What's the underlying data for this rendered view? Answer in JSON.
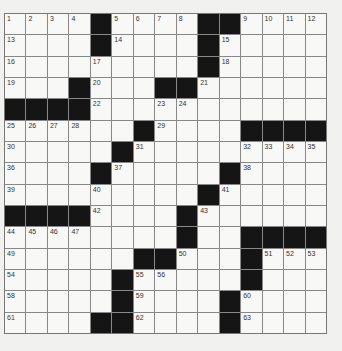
{
  "puzzle": {
    "type": "crossword",
    "rows": 15,
    "cols": 15,
    "colors": {
      "background": "#f1f1ef",
      "cell": "#f8f8f6",
      "block": "#151515",
      "gridline": "#888888",
      "number": "#333333"
    },
    "layout": [
      "....#....##....",
      "....#....#.....",
      ".........#.....",
      "...#...##......",
      "####...........",
      "......#....####",
      ".....#.........",
      "....#.....#....",
      ".........#.....",
      "####....#......",
      "........#..####",
      "......##...#...",
      ".....#.....#...",
      ".....#....#....",
      "....##....#...."
    ],
    "numbers": [
      {
        "r": 0,
        "c": 0,
        "n": "1"
      },
      {
        "r": 0,
        "c": 1,
        "n": "2"
      },
      {
        "r": 0,
        "c": 2,
        "n": "3"
      },
      {
        "r": 0,
        "c": 3,
        "n": "4"
      },
      {
        "r": 0,
        "c": 5,
        "n": "5"
      },
      {
        "r": 0,
        "c": 6,
        "n": "6"
      },
      {
        "r": 0,
        "c": 7,
        "n": "7"
      },
      {
        "r": 0,
        "c": 8,
        "n": "8"
      },
      {
        "r": 0,
        "c": 11,
        "n": "9"
      },
      {
        "r": 0,
        "c": 12,
        "n": "10"
      },
      {
        "r": 0,
        "c": 13,
        "n": "11"
      },
      {
        "r": 0,
        "c": 14,
        "n": "12"
      },
      {
        "r": 1,
        "c": 0,
        "n": "13"
      },
      {
        "r": 1,
        "c": 5,
        "n": "14"
      },
      {
        "r": 1,
        "c": 10,
        "n": "15"
      },
      {
        "r": 2,
        "c": 0,
        "n": "16"
      },
      {
        "r": 2,
        "c": 4,
        "n": "17"
      },
      {
        "r": 2,
        "c": 10,
        "n": "18"
      },
      {
        "r": 3,
        "c": 0,
        "n": "19"
      },
      {
        "r": 3,
        "c": 4,
        "n": "20"
      },
      {
        "r": 3,
        "c": 9,
        "n": "21"
      },
      {
        "r": 4,
        "c": 4,
        "n": "22"
      },
      {
        "r": 4,
        "c": 7,
        "n": "23"
      },
      {
        "r": 4,
        "c": 8,
        "n": "24"
      },
      {
        "r": 5,
        "c": 0,
        "n": "25"
      },
      {
        "r": 5,
        "c": 1,
        "n": "26"
      },
      {
        "r": 5,
        "c": 2,
        "n": "27"
      },
      {
        "r": 5,
        "c": 3,
        "n": "28"
      },
      {
        "r": 5,
        "c": 7,
        "n": "29"
      },
      {
        "r": 6,
        "c": 0,
        "n": "30"
      },
      {
        "r": 6,
        "c": 6,
        "n": "31"
      },
      {
        "r": 6,
        "c": 11,
        "n": "32"
      },
      {
        "r": 6,
        "c": 12,
        "n": "33"
      },
      {
        "r": 6,
        "c": 13,
        "n": "34"
      },
      {
        "r": 6,
        "c": 14,
        "n": "35"
      },
      {
        "r": 7,
        "c": 0,
        "n": "36"
      },
      {
        "r": 7,
        "c": 5,
        "n": "37"
      },
      {
        "r": 7,
        "c": 11,
        "n": "38"
      },
      {
        "r": 8,
        "c": 0,
        "n": "39"
      },
      {
        "r": 8,
        "c": 4,
        "n": "40"
      },
      {
        "r": 8,
        "c": 10,
        "n": "41"
      },
      {
        "r": 9,
        "c": 4,
        "n": "42"
      },
      {
        "r": 9,
        "c": 9,
        "n": "43"
      },
      {
        "r": 10,
        "c": 0,
        "n": "44"
      },
      {
        "r": 10,
        "c": 1,
        "n": "45"
      },
      {
        "r": 10,
        "c": 2,
        "n": "46"
      },
      {
        "r": 10,
        "c": 3,
        "n": "47"
      },
      {
        "r": 10,
        "c": 8,
        "n": "48"
      },
      {
        "r": 11,
        "c": 0,
        "n": "49"
      },
      {
        "r": 11,
        "c": 8,
        "n": "50"
      },
      {
        "r": 11,
        "c": 12,
        "n": "51"
      },
      {
        "r": 11,
        "c": 13,
        "n": "52"
      },
      {
        "r": 11,
        "c": 14,
        "n": "53"
      },
      {
        "r": 12,
        "c": 0,
        "n": "54"
      },
      {
        "r": 12,
        "c": 6,
        "n": "55"
      },
      {
        "r": 12,
        "c": 7,
        "n": "56"
      },
      {
        "r": 12,
        "c": 11,
        "n": "57"
      },
      {
        "r": 13,
        "c": 0,
        "n": "58"
      },
      {
        "r": 13,
        "c": 6,
        "n": "59"
      },
      {
        "r": 13,
        "c": 11,
        "n": "60"
      },
      {
        "r": 14,
        "c": 0,
        "n": "61"
      },
      {
        "r": 14,
        "c": 6,
        "n": "62"
      },
      {
        "r": 14,
        "c": 11,
        "n": "63"
      }
    ]
  }
}
